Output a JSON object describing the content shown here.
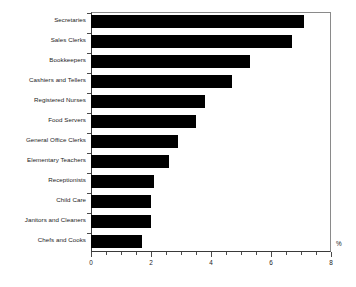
{
  "chart_data": {
    "type": "bar",
    "orientation": "horizontal",
    "title": "",
    "subtitle": "",
    "xlabel": "%",
    "ylabel": "",
    "categories": [
      "Secretaries",
      "Sales Clerks",
      "Bookkeepers",
      "Cashiers and Tellers",
      "Registered Nurses",
      "Food Servers",
      "General Office Clerks",
      "Elementary Teachers",
      "Receptionists",
      "Child Care",
      "Janitors and Cleaners",
      "Chefs and Cooks"
    ],
    "values": [
      7.1,
      6.7,
      5.3,
      4.7,
      3.8,
      3.5,
      2.9,
      2.6,
      2.1,
      2.0,
      2.0,
      1.7
    ],
    "xlim": [
      0,
      8
    ],
    "xticks": [
      0,
      2,
      4,
      6,
      8
    ],
    "xtick_labels": [
      "0",
      "2",
      "4",
      "6",
      "8"
    ],
    "minor_tick_step": 0.5,
    "grid": false,
    "legend": null,
    "bar_color": "#000000",
    "axis_color": "#3a3a3a",
    "background": "#ffffff"
  },
  "axis": {
    "unit_symbol": "%"
  }
}
